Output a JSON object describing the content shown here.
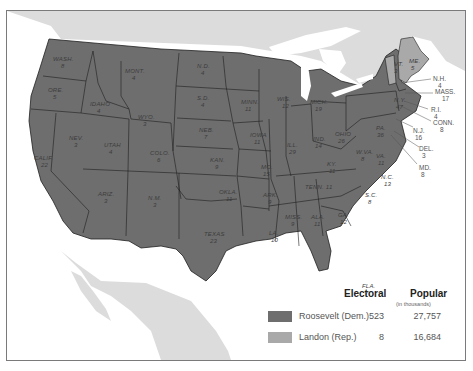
{
  "map": {
    "title": "1936 Presidential Election",
    "colors": {
      "roosevelt": "#6e6e6e",
      "landon": "#a9a9a9",
      "water": "#ffffff",
      "foreign_land": "#dcdcdc",
      "border": "#1f1f1f",
      "frame": "#7a7a7a"
    },
    "states": [
      {
        "abbr": "WASH",
        "ev": "8",
        "winner": "Roosevelt"
      },
      {
        "abbr": "ORE",
        "ev": "5",
        "winner": "Roosevelt"
      },
      {
        "abbr": "CALIF",
        "ev": "22",
        "winner": "Roosevelt"
      },
      {
        "abbr": "IDAHO",
        "ev": "4",
        "winner": "Roosevelt"
      },
      {
        "abbr": "NEV",
        "ev": "3",
        "winner": "Roosevelt"
      },
      {
        "abbr": "MONT",
        "ev": "4",
        "winner": "Roosevelt"
      },
      {
        "abbr": "WYO",
        "ev": "3",
        "winner": "Roosevelt"
      },
      {
        "abbr": "UTAH",
        "ev": "4",
        "winner": "Roosevelt"
      },
      {
        "abbr": "ARIZ",
        "ev": "3",
        "winner": "Roosevelt"
      },
      {
        "abbr": "COLO",
        "ev": "6",
        "winner": "Roosevelt"
      },
      {
        "abbr": "N.M.",
        "ev": "3",
        "winner": "Roosevelt"
      },
      {
        "abbr": "N.D.",
        "ev": "4",
        "winner": "Roosevelt"
      },
      {
        "abbr": "S.D.",
        "ev": "4",
        "winner": "Roosevelt"
      },
      {
        "abbr": "NEB.",
        "ev": "7",
        "winner": "Roosevelt"
      },
      {
        "abbr": "KAN.",
        "ev": "9",
        "winner": "Roosevelt"
      },
      {
        "abbr": "OKLA.",
        "ev": "11",
        "winner": "Roosevelt"
      },
      {
        "abbr": "TEXAS",
        "ev": "23",
        "winner": "Roosevelt"
      },
      {
        "abbr": "MINN.",
        "ev": "11",
        "winner": "Roosevelt"
      },
      {
        "abbr": "IOWA",
        "ev": "11",
        "winner": "Roosevelt"
      },
      {
        "abbr": "MO.",
        "ev": "15",
        "winner": "Roosevelt"
      },
      {
        "abbr": "ARK.",
        "ev": "9",
        "winner": "Roosevelt"
      },
      {
        "abbr": "LA.",
        "ev": "10",
        "winner": "Roosevelt"
      },
      {
        "abbr": "WIS.",
        "ev": "12",
        "winner": "Roosevelt"
      },
      {
        "abbr": "ILL.",
        "ev": "29",
        "winner": "Roosevelt"
      },
      {
        "abbr": "MICH.",
        "ev": "19",
        "winner": "Roosevelt"
      },
      {
        "abbr": "IND.",
        "ev": "14",
        "winner": "Roosevelt"
      },
      {
        "abbr": "OHIO",
        "ev": "26",
        "winner": "Roosevelt"
      },
      {
        "abbr": "KY.",
        "ev": "11",
        "winner": "Roosevelt"
      },
      {
        "abbr": "TENN.",
        "ev": "11",
        "winner": "Roosevelt"
      },
      {
        "abbr": "MISS.",
        "ev": "9",
        "winner": "Roosevelt"
      },
      {
        "abbr": "ALA.",
        "ev": "11",
        "winner": "Roosevelt"
      },
      {
        "abbr": "GA.",
        "ev": "12",
        "winner": "Roosevelt"
      },
      {
        "abbr": "FLA.",
        "ev": "7",
        "winner": "Roosevelt"
      },
      {
        "abbr": "S.C.",
        "ev": "8",
        "winner": "Roosevelt"
      },
      {
        "abbr": "N.C.",
        "ev": "13",
        "winner": "Roosevelt"
      },
      {
        "abbr": "VA.",
        "ev": "11",
        "winner": "Roosevelt"
      },
      {
        "abbr": "W.VA.",
        "ev": "8",
        "winner": "Roosevelt"
      },
      {
        "abbr": "PA.",
        "ev": "36",
        "winner": "Roosevelt"
      },
      {
        "abbr": "N.Y.",
        "ev": "47",
        "winner": "Roosevelt"
      },
      {
        "abbr": "VT.",
        "ev": "3",
        "winner": "Landon"
      },
      {
        "abbr": "ME.",
        "ev": "5",
        "winner": "Landon"
      },
      {
        "abbr": "N.H.",
        "ev": "4",
        "winner": "Roosevelt"
      },
      {
        "abbr": "MASS.",
        "ev": "17",
        "winner": "Roosevelt"
      },
      {
        "abbr": "R.I.",
        "ev": "4",
        "winner": "Roosevelt"
      },
      {
        "abbr": "CONN.",
        "ev": "8",
        "winner": "Roosevelt"
      },
      {
        "abbr": "N.J.",
        "ev": "16",
        "winner": "Roosevelt"
      },
      {
        "abbr": "DEL.",
        "ev": "3",
        "winner": "Roosevelt"
      },
      {
        "abbr": "MD.",
        "ev": "8",
        "winner": "Roosevelt"
      }
    ]
  },
  "legend": {
    "electoral_header": "Electoral",
    "popular_header": "Popular",
    "popular_sub": "(in thousands)",
    "rows": [
      {
        "name": "Roosevelt (Dem.)",
        "electoral": "523",
        "popular": "27,757",
        "color": "#6e6e6e"
      },
      {
        "name": "Landon (Rep.)",
        "electoral": "8",
        "popular": "16,684",
        "color": "#a9a9a9"
      }
    ]
  }
}
